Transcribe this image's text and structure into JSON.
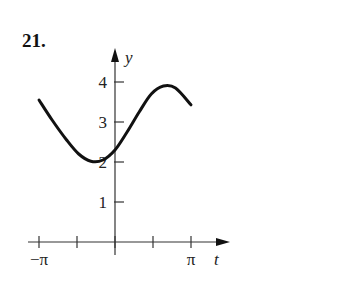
{
  "problem": {
    "number": "21."
  },
  "chart_data": {
    "type": "line",
    "title": "",
    "xlabel": "t",
    "ylabel": "y",
    "x_tick_labels": [
      {
        "pos": -3.14159,
        "label": "−π"
      },
      {
        "pos": 3.14159,
        "label": "π"
      }
    ],
    "x_ticks": [
      -3.14159,
      -1.5708,
      0,
      1.5708,
      3.14159
    ],
    "y_ticks": [
      1,
      2,
      3,
      4
    ],
    "y_tick_labels": [
      "1",
      "2",
      "3",
      "4"
    ],
    "xlim": [
      -3.14159,
      3.8
    ],
    "ylim": [
      0,
      4.8
    ],
    "grid": false,
    "series": [
      {
        "name": "y(t)",
        "x": [
          -3.14,
          -2.6,
          -2.0,
          -1.5,
          -1.0,
          -0.5,
          0.0,
          0.5,
          1.0,
          1.5,
          2.0,
          2.5,
          3.14
        ],
        "values": [
          3.55,
          3.05,
          2.55,
          2.2,
          2.02,
          2.05,
          2.3,
          2.75,
          3.25,
          3.7,
          3.9,
          3.85,
          3.43
        ]
      }
    ]
  }
}
